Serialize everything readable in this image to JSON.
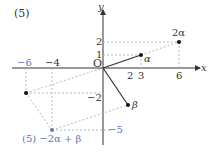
{
  "problem_label": "(5)",
  "axes": {
    "x_label": "x",
    "y_label": "y",
    "origin_label": "O"
  },
  "ticks": {
    "x_pos": [
      "2",
      "3",
      "6"
    ],
    "x_neg": [
      "−6",
      "−4"
    ],
    "y_pos": [
      "1",
      "2"
    ],
    "y_neg": [
      "−2",
      "−5"
    ]
  },
  "points": {
    "alpha": {
      "label": "α",
      "coords": [
        3,
        1
      ]
    },
    "two_alpha": {
      "label": "2α",
      "coords": [
        6,
        2
      ]
    },
    "beta": {
      "label": "β",
      "coords": [
        2,
        -3
      ]
    },
    "neg_two_alpha": {
      "label": "",
      "coords": [
        -6,
        -2
      ]
    },
    "result": {
      "label": "(5)  −2α + β",
      "coords": [
        -4,
        -5
      ]
    }
  },
  "colors": {
    "axis": "#333333",
    "vector": "#333333",
    "guide": "#999999",
    "result": "#5b79b8"
  }
}
